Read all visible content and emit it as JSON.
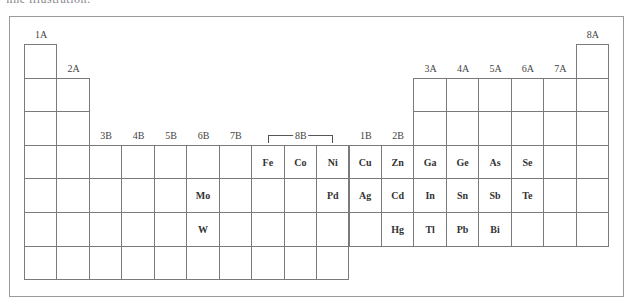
{
  "caption_fragment": "ﬁne illustration:",
  "table": {
    "grid": {
      "origin_x": 25,
      "origin_y": 45,
      "col_width": 32.45,
      "row_height": 33.6,
      "columns": 18,
      "rows": 7
    },
    "group_labels": [
      {
        "label": "1A",
        "col": 1,
        "row_above": 1
      },
      {
        "label": "2A",
        "col": 2,
        "row_above": 2
      },
      {
        "label": "3B",
        "col": 3,
        "row_above": 4
      },
      {
        "label": "4B",
        "col": 4,
        "row_above": 4
      },
      {
        "label": "5B",
        "col": 5,
        "row_above": 4
      },
      {
        "label": "6B",
        "col": 6,
        "row_above": 4
      },
      {
        "label": "7B",
        "col": 7,
        "row_above": 4
      },
      {
        "label": "1B",
        "col": 11,
        "row_above": 4
      },
      {
        "label": "2B",
        "col": 12,
        "row_above": 4
      },
      {
        "label": "3A",
        "col": 13,
        "row_above": 2
      },
      {
        "label": "4A",
        "col": 14,
        "row_above": 2
      },
      {
        "label": "5A",
        "col": 15,
        "row_above": 2
      },
      {
        "label": "6A",
        "col": 16,
        "row_above": 2
      },
      {
        "label": "7A",
        "col": 17,
        "row_above": 2
      },
      {
        "label": "8A",
        "col": 18,
        "row_above": 1
      }
    ],
    "bracket": {
      "label": "8B",
      "from_col": 8,
      "to_col": 10
    },
    "elements": [
      {
        "symbol": "Fe",
        "row": 4,
        "col": 8
      },
      {
        "symbol": "Co",
        "row": 4,
        "col": 9
      },
      {
        "symbol": "Ni",
        "row": 4,
        "col": 10
      },
      {
        "symbol": "Cu",
        "row": 4,
        "col": 11
      },
      {
        "symbol": "Zn",
        "row": 4,
        "col": 12
      },
      {
        "symbol": "Ga",
        "row": 4,
        "col": 13
      },
      {
        "symbol": "Ge",
        "row": 4,
        "col": 14
      },
      {
        "symbol": "As",
        "row": 4,
        "col": 15
      },
      {
        "symbol": "Se",
        "row": 4,
        "col": 16
      },
      {
        "symbol": "Mo",
        "row": 5,
        "col": 6
      },
      {
        "symbol": "Pd",
        "row": 5,
        "col": 10
      },
      {
        "symbol": "Ag",
        "row": 5,
        "col": 11
      },
      {
        "symbol": "Cd",
        "row": 5,
        "col": 12
      },
      {
        "symbol": "In",
        "row": 5,
        "col": 13
      },
      {
        "symbol": "Sn",
        "row": 5,
        "col": 14
      },
      {
        "symbol": "Sb",
        "row": 5,
        "col": 15
      },
      {
        "symbol": "Te",
        "row": 5,
        "col": 16
      },
      {
        "symbol": "W",
        "row": 6,
        "col": 6
      },
      {
        "symbol": "Hg",
        "row": 6,
        "col": 12
      },
      {
        "symbol": "Tl",
        "row": 6,
        "col": 13
      },
      {
        "symbol": "Pb",
        "row": 6,
        "col": 14
      },
      {
        "symbol": "Bi",
        "row": 6,
        "col": 15
      }
    ],
    "row_spans": [
      {
        "row": 1,
        "cols": [
          1,
          18
        ]
      },
      {
        "row": 2,
        "cols": [
          1,
          2,
          13,
          14,
          15,
          16,
          17,
          18
        ]
      },
      {
        "row": 3,
        "cols": [
          1,
          2,
          13,
          14,
          15,
          16,
          17,
          18
        ]
      },
      {
        "row": 4,
        "cols": "all"
      },
      {
        "row": 5,
        "cols": "all"
      },
      {
        "row": 6,
        "cols": "all"
      },
      {
        "row": 7,
        "cols": [
          1,
          2,
          3,
          4,
          5,
          6,
          7,
          8,
          9,
          10
        ]
      }
    ]
  }
}
